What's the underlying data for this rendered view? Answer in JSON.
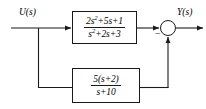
{
  "diagram": {
    "type": "control-system-block-diagram",
    "input_signal": "U(s)",
    "output_signal": "Y(s)",
    "summing_junction": {
      "input_sign": "+",
      "feedback_sign": "−",
      "feedback_sign_label": "−"
    },
    "forward_block": {
      "name": "forward-path-transfer-function",
      "numerator": "2s²+5s+1",
      "denominator": "s²+2s+3",
      "num_parts": {
        "a": "2s",
        "a_exp": "2",
        "b": "+5s+1"
      },
      "den_parts": {
        "a": "s",
        "a_exp": "2",
        "b": "+2s+3"
      }
    },
    "feedback_block": {
      "name": "feedback-path-transfer-function",
      "numerator": "5(s+2)",
      "denominator": "s+10"
    },
    "colors": {
      "line": "#1a1a1a",
      "background": "#ffffff",
      "text": "#000000"
    }
  }
}
